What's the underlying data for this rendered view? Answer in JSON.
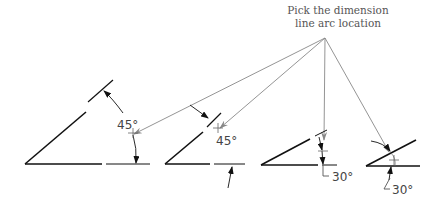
{
  "callout": {
    "line1": "Pick the dimension",
    "line2": "line arc location"
  },
  "examples": [
    {
      "id": "example-1",
      "angle_label": "45°"
    },
    {
      "id": "example-2",
      "angle_label": "45°"
    },
    {
      "id": "example-3",
      "angle_label": "30°"
    },
    {
      "id": "example-4",
      "angle_label": "30°"
    }
  ],
  "colors": {
    "geometry": "#111111",
    "leader": "#888888",
    "text": "#555555"
  }
}
